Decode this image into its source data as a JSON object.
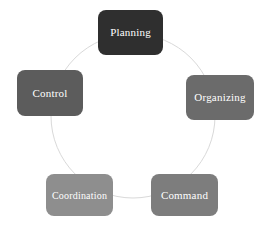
{
  "diagram": {
    "background_color": "#ffffff",
    "ring": {
      "name": "cycle-ring",
      "stroke_color": "#d9d9d9",
      "stroke_width": 1,
      "center_x": 133,
      "center_y": 116,
      "radius": 82
    },
    "nodes": [
      {
        "id": "planning",
        "label": "Planning",
        "fill_color": "#2f2f2f",
        "text_color": "#ffffff",
        "position": "top"
      },
      {
        "id": "organizing",
        "label": "Organizing",
        "fill_color": "#6b6b6b",
        "text_color": "#ffffff",
        "position": "right-upper"
      },
      {
        "id": "command",
        "label": "Command",
        "fill_color": "#7d7d7d",
        "text_color": "#ffffff",
        "position": "right-lower"
      },
      {
        "id": "coordination",
        "label": "Coordination",
        "fill_color": "#8e8e8e",
        "text_color": "#ffffff",
        "position": "left-lower"
      },
      {
        "id": "control",
        "label": "Control",
        "fill_color": "#5c5c5c",
        "text_color": "#ffffff",
        "position": "left-upper"
      }
    ]
  }
}
